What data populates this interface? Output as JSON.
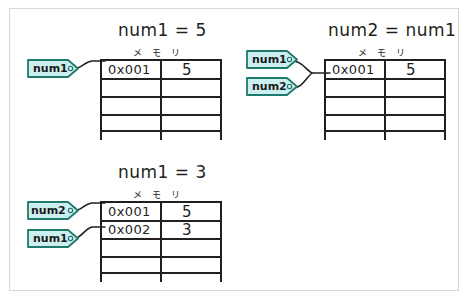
{
  "diagram": {
    "title_color": "#231f20",
    "tag_fill": "#cdeef0",
    "tag_stroke": "#1f7a6b",
    "line_color": "#231f20",
    "frame_color": "#d8d8d8"
  },
  "panels": [
    {
      "id": "panel-num1-equals-5",
      "title": "num1 = 5",
      "memory_label": "メ モ リ",
      "tags": [
        {
          "name": "num1",
          "row": 0
        }
      ],
      "rows": [
        {
          "address": "0x001",
          "value": "5"
        },
        {
          "address": "",
          "value": ""
        },
        {
          "address": "",
          "value": ""
        },
        {
          "address": "",
          "value": ""
        }
      ]
    },
    {
      "id": "panel-num2-equals-num1",
      "title": "num2 = num1",
      "memory_label": "メ モ リ",
      "tags": [
        {
          "name": "num1",
          "row": 0
        },
        {
          "name": "num2",
          "row": 0
        }
      ],
      "rows": [
        {
          "address": "0x001",
          "value": "5"
        },
        {
          "address": "",
          "value": ""
        },
        {
          "address": "",
          "value": ""
        },
        {
          "address": "",
          "value": ""
        }
      ]
    },
    {
      "id": "panel-num1-equals-3",
      "title": "num1 = 3",
      "memory_label": "メ モ リ",
      "tags": [
        {
          "name": "num2",
          "row": 0
        },
        {
          "name": "num1",
          "row": 1
        }
      ],
      "rows": [
        {
          "address": "0x001",
          "value": "5"
        },
        {
          "address": "0x002",
          "value": "3"
        },
        {
          "address": "",
          "value": ""
        },
        {
          "address": "",
          "value": ""
        }
      ]
    }
  ]
}
